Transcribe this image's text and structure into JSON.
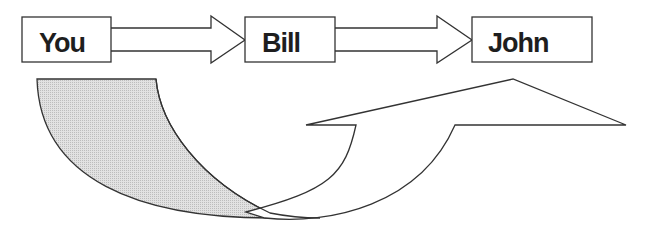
{
  "diagram": {
    "type": "flow",
    "nodes": [
      {
        "id": "you",
        "label": "You"
      },
      {
        "id": "bill",
        "label": "Bill"
      },
      {
        "id": "john",
        "label": "John"
      }
    ],
    "edges": [
      {
        "from": "you",
        "to": "bill",
        "style": "block-arrow"
      },
      {
        "from": "bill",
        "to": "john",
        "style": "block-arrow"
      }
    ],
    "decorations": [
      {
        "name": "shaded-curved-band",
        "fill": "#d6d6d6"
      },
      {
        "name": "curved-up-arrow",
        "fill": "#ffffff"
      }
    ]
  },
  "colors": {
    "stroke": "#333333",
    "shade": "#d6d6d6",
    "background": "#ffffff"
  }
}
